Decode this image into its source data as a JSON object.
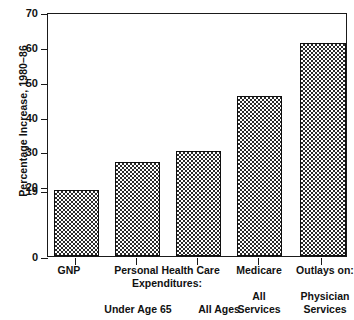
{
  "chart_data": {
    "type": "bar",
    "title": "",
    "xlabel": "",
    "ylabel": "Percentage Increase, 1980–86",
    "ylim": [
      0,
      70
    ],
    "grid": false,
    "legend": null,
    "categories": [
      "GNP",
      "Under Age 65",
      "All Ages",
      "All Services",
      "Physician Services"
    ],
    "values": [
      19,
      27,
      30,
      46,
      61
    ],
    "ytick_labels": [
      "0",
      "19",
      "20",
      "30",
      "40",
      "50",
      "60",
      "70"
    ],
    "ytick_values": [
      0,
      19,
      20,
      30,
      40,
      50,
      60,
      70
    ],
    "group_headers": [
      "GNP",
      "Personal Health Care Expenditures:",
      "Medicare",
      "Outlays on:"
    ],
    "annotations": [
      "19 tick marks the GNP bar height"
    ]
  },
  "axis": {
    "y_title": "Percentage Increase, 1980–86",
    "ticks": [
      {
        "label": "70",
        "value": 70
      },
      {
        "label": "60",
        "value": 60
      },
      {
        "label": "50",
        "value": 50
      },
      {
        "label": "40",
        "value": 40
      },
      {
        "label": "30",
        "value": 30
      },
      {
        "label": "20",
        "value": 20
      },
      {
        "label": "19",
        "value": 19
      },
      {
        "label": "0",
        "value": 0
      }
    ]
  },
  "bars": [
    {
      "name": "gnp",
      "value": 19
    },
    {
      "name": "under-age-65",
      "value": 27
    },
    {
      "name": "all-ages",
      "value": 30
    },
    {
      "name": "all-services",
      "value": 46
    },
    {
      "name": "physician-services",
      "value": 61
    }
  ],
  "xlabels": {
    "row1": [
      {
        "text": "GNP"
      },
      {
        "text": "Personal Health Care"
      },
      {
        "text": "Medicare"
      },
      {
        "text": "Outlays on:"
      }
    ],
    "row2": [
      {
        "text": "Expenditures:"
      }
    ],
    "row3": [
      {
        "text": "Under Age 65"
      },
      {
        "text": "All Ages"
      },
      {
        "text": "All"
      },
      {
        "text": "Physician"
      }
    ],
    "row4": [
      {
        "text": "Services"
      },
      {
        "text": "Services"
      }
    ]
  },
  "colors": {
    "axis": "#1a1a1a",
    "bar_outline": "#101010",
    "bar_hatch": "#2b2b2b",
    "background": "#ffffff",
    "text": "#111111"
  }
}
